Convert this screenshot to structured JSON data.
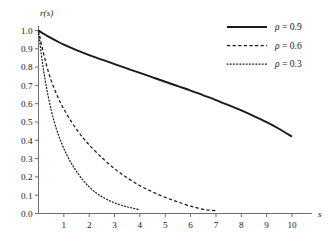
{
  "chart_data": {
    "type": "line",
    "title": "",
    "xlabel": "s",
    "ylabel": "r(s)",
    "xlim": [
      0,
      10.8
    ],
    "ylim": [
      0,
      1.0
    ],
    "xticks": [
      1,
      2,
      3,
      4,
      5,
      6,
      7,
      8,
      9,
      10
    ],
    "xtick_labels": [
      "1",
      "2",
      "3",
      "4",
      "5",
      "6",
      "7",
      "8",
      "9",
      "10"
    ],
    "yticks": [
      0.0,
      0.1,
      0.2,
      0.3,
      0.4,
      0.5,
      0.6,
      0.7,
      0.8,
      0.9,
      1.0
    ],
    "ytick_labels": [
      "0.0",
      "0.1",
      "0.2",
      "0.3",
      "0.4",
      "0.5",
      "0.6",
      "0.7",
      "0.8",
      "0.9",
      "1.0"
    ],
    "grid": false,
    "legend_position": "top-right",
    "axis_color": "#6e6e6e",
    "curve_color": "#1a1a1a",
    "series": [
      {
        "name": "rho = 0.9",
        "rho": 0.9,
        "style": "solid",
        "legend_label": "= 0.9",
        "legend_symbol": "ρ",
        "x": [
          0,
          0.25,
          0.5,
          0.75,
          1,
          1.5,
          2,
          2.5,
          3,
          3.5,
          4,
          4.5,
          5,
          5.5,
          6,
          6.5,
          7,
          7.5,
          8,
          8.5,
          9,
          9.5,
          10
        ],
        "y": [
          1.0,
          0.978,
          0.958,
          0.94,
          0.923,
          0.893,
          0.866,
          0.841,
          0.816,
          0.792,
          0.768,
          0.744,
          0.72,
          0.696,
          0.672,
          0.646,
          0.62,
          0.592,
          0.563,
          0.532,
          0.499,
          0.462,
          0.42
        ]
      },
      {
        "name": "rho = 0.6",
        "rho": 0.6,
        "style": "dashed",
        "legend_label": "= 0.6",
        "legend_symbol": "ρ",
        "x": [
          0,
          0.2,
          0.4,
          0.6,
          0.8,
          1,
          1.25,
          1.5,
          1.75,
          2,
          2.5,
          3,
          3.5,
          4,
          4.5,
          5,
          5.5,
          6,
          6.25,
          6.5,
          6.75,
          7
        ],
        "y": [
          1.0,
          0.875,
          0.77,
          0.69,
          0.625,
          0.57,
          0.512,
          0.46,
          0.415,
          0.375,
          0.305,
          0.245,
          0.195,
          0.152,
          0.118,
          0.088,
          0.063,
          0.04,
          0.031,
          0.023,
          0.018,
          0.015
        ]
      },
      {
        "name": "rho = 0.3",
        "rho": 0.3,
        "style": "dotted",
        "legend_label": "= 0.3",
        "legend_symbol": "ρ",
        "x": [
          0,
          0.15,
          0.3,
          0.5,
          0.7,
          0.9,
          1.1,
          1.3,
          1.5,
          1.75,
          2,
          2.25,
          2.5,
          2.75,
          3,
          3.25,
          3.5,
          3.75,
          4
        ],
        "y": [
          1.0,
          0.83,
          0.7,
          0.565,
          0.465,
          0.388,
          0.325,
          0.273,
          0.23,
          0.183,
          0.145,
          0.115,
          0.092,
          0.073,
          0.058,
          0.046,
          0.036,
          0.028,
          0.021
        ]
      }
    ]
  },
  "legend": {
    "items": [
      {
        "label": "= 0.9",
        "symbol": "ρ",
        "style": "solid"
      },
      {
        "label": "= 0.6",
        "symbol": "ρ",
        "style": "dashed"
      },
      {
        "label": "= 0.3",
        "symbol": "ρ",
        "style": "dotted"
      }
    ]
  }
}
